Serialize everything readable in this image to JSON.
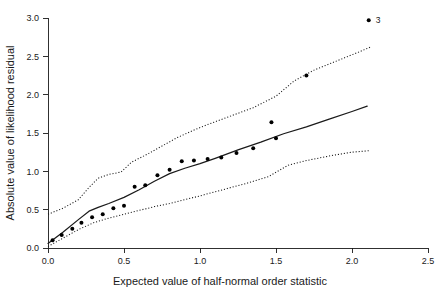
{
  "chart_data": {
    "type": "scatter",
    "title": "",
    "subtitle": "",
    "xlabel": "Expected value of half-normal order statistic",
    "ylabel": "Absolute value of likelihood residual",
    "xlim": [
      0.0,
      2.5
    ],
    "ylim": [
      0.0,
      3.0
    ],
    "xticks": [
      0.0,
      0.5,
      1.0,
      1.5,
      2.0,
      2.5
    ],
    "xtick_labels": [
      "0.0",
      "0.5",
      "1.0",
      "1.5",
      "2.0",
      "2.5"
    ],
    "yticks": [
      0.0,
      0.5,
      1.0,
      1.5,
      2.0,
      2.5,
      3.0
    ],
    "ytick_labels": [
      "0.0",
      "0.5",
      "1.0",
      "1.5",
      "2.0",
      "2.5",
      "3.0"
    ],
    "grid": false,
    "legend": false,
    "legend_position": "none",
    "marker": "filled-circle",
    "marker_color": "#000000",
    "marker_size": 4.0,
    "points": [
      {
        "x": 0.03,
        "y": 0.1
      },
      {
        "x": 0.09,
        "y": 0.17
      },
      {
        "x": 0.16,
        "y": 0.25
      },
      {
        "x": 0.22,
        "y": 0.33
      },
      {
        "x": 0.29,
        "y": 0.4
      },
      {
        "x": 0.36,
        "y": 0.44
      },
      {
        "x": 0.43,
        "y": 0.52
      },
      {
        "x": 0.5,
        "y": 0.55
      },
      {
        "x": 0.57,
        "y": 0.8
      },
      {
        "x": 0.64,
        "y": 0.82
      },
      {
        "x": 0.72,
        "y": 0.95
      },
      {
        "x": 0.8,
        "y": 1.02
      },
      {
        "x": 0.88,
        "y": 1.13
      },
      {
        "x": 0.96,
        "y": 1.14
      },
      {
        "x": 1.05,
        "y": 1.16
      },
      {
        "x": 1.14,
        "y": 1.18
      },
      {
        "x": 1.24,
        "y": 1.24
      },
      {
        "x": 1.35,
        "y": 1.3
      },
      {
        "x": 1.47,
        "y": 1.64
      },
      {
        "x": 1.5,
        "y": 1.43
      },
      {
        "x": 1.7,
        "y": 2.25
      },
      {
        "x": 2.11,
        "y": 2.97
      }
    ],
    "annotations": [
      {
        "label": "3",
        "x": 2.11,
        "y": 2.97,
        "position": "right"
      }
    ],
    "series": [
      {
        "name": "median",
        "style": "solid",
        "color": "#1a1a1a",
        "x": [
          0.0,
          0.1,
          0.2,
          0.27,
          0.33,
          0.4,
          0.5,
          0.6,
          0.7,
          0.8,
          0.9,
          1.0,
          1.1,
          1.25,
          1.4,
          1.55,
          1.7,
          1.85,
          2.0,
          2.1
        ],
        "y": [
          0.06,
          0.21,
          0.37,
          0.48,
          0.53,
          0.58,
          0.66,
          0.76,
          0.87,
          0.97,
          1.04,
          1.1,
          1.17,
          1.28,
          1.38,
          1.49,
          1.58,
          1.68,
          1.78,
          1.85
        ]
      },
      {
        "name": "upper-envelope",
        "style": "dotted",
        "color": "#1a1a1a",
        "x": [
          0.0,
          0.1,
          0.2,
          0.27,
          0.33,
          0.4,
          0.48,
          0.55,
          0.65,
          0.75,
          0.85,
          0.95,
          1.05,
          1.2,
          1.35,
          1.5,
          1.62,
          1.75,
          1.9,
          2.05,
          2.12
        ],
        "y": [
          0.44,
          0.52,
          0.63,
          0.79,
          0.91,
          0.96,
          0.99,
          1.12,
          1.22,
          1.33,
          1.44,
          1.53,
          1.61,
          1.72,
          1.83,
          1.98,
          2.18,
          2.32,
          2.44,
          2.56,
          2.62
        ]
      },
      {
        "name": "lower-envelope",
        "style": "dotted",
        "color": "#1a1a1a",
        "x": [
          0.0,
          0.1,
          0.2,
          0.3,
          0.4,
          0.5,
          0.6,
          0.7,
          0.8,
          0.9,
          1.0,
          1.15,
          1.3,
          1.45,
          1.58,
          1.7,
          1.85,
          2.0,
          2.12
        ],
        "y": [
          0.02,
          0.13,
          0.24,
          0.33,
          0.39,
          0.44,
          0.49,
          0.54,
          0.58,
          0.63,
          0.68,
          0.76,
          0.84,
          0.93,
          1.08,
          1.14,
          1.2,
          1.25,
          1.27
        ]
      }
    ]
  },
  "figure": {
    "background_color": "#ffffff",
    "axis_color": "#1a1a1a"
  }
}
